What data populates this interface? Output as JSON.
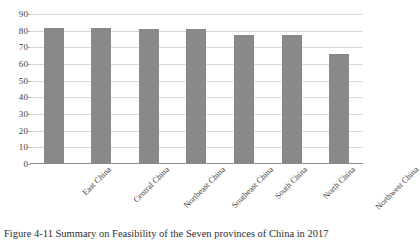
{
  "chart_data": {
    "type": "bar",
    "title": "",
    "xlabel": "",
    "ylabel": "",
    "ylim": [
      0,
      90
    ],
    "ystep": 10,
    "grid": true,
    "legend": "none",
    "bar_color": "#898989",
    "categories": [
      "East China",
      "Central China",
      "Northeast China",
      "Southeast China",
      "South China",
      "North China",
      "Northwest China"
    ],
    "values": [
      81.5,
      81.5,
      81.3,
      81.0,
      77.2,
      77.2,
      66.0
    ],
    "yticks": [
      "0",
      "10",
      "20",
      "30",
      "40",
      "50",
      "60",
      "70",
      "80",
      "90"
    ]
  },
  "caption": {
    "text": "Figure 4-11  Summary on Feasibility of the Seven provinces of China in 2017"
  }
}
